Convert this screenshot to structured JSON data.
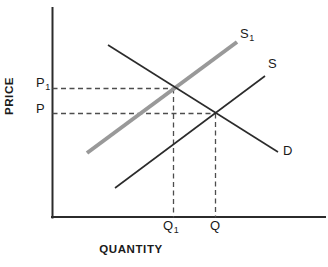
{
  "chart_data": {
    "type": "line",
    "title": "",
    "xlabel": "QUANTITY",
    "ylabel": "PRICE",
    "grid": false,
    "legend": "inline-curve-labels",
    "axes": {
      "x_axis": {
        "label": "QUANTITY",
        "ticks": [
          "Q1",
          "Q"
        ],
        "arrow": false
      },
      "y_axis": {
        "label": "PRICE",
        "ticks": [
          "P1",
          "P"
        ],
        "arrow": false
      }
    },
    "curves": [
      {
        "name": "S1",
        "label": "S₁",
        "role": "shifted-supply",
        "color": "#999999",
        "style": "solid",
        "width": 4,
        "points": [
          [
            87,
            153
          ],
          [
            237,
            42
          ]
        ]
      },
      {
        "name": "S",
        "label": "S",
        "role": "supply",
        "color": "#2b2b2b",
        "style": "solid",
        "width": 1.6,
        "points": [
          [
            115,
            188
          ],
          [
            265,
            76
          ]
        ]
      },
      {
        "name": "D",
        "label": "D",
        "role": "demand",
        "color": "#2b2b2b",
        "style": "solid",
        "width": 1.6,
        "points": [
          [
            108,
            45
          ],
          [
            278,
            152
          ]
        ]
      }
    ],
    "equilibria": [
      {
        "name": "new-equilibrium",
        "price_label": "P1",
        "quantity_label": "Q1",
        "x": 173,
        "y": 88,
        "curves": [
          "S1",
          "D"
        ]
      },
      {
        "name": "original-equilibrium",
        "price_label": "P",
        "quantity_label": "Q",
        "x": 215,
        "y": 113,
        "curves": [
          "S",
          "D"
        ]
      }
    ],
    "guides": [
      {
        "name": "p1-guide",
        "orientation": "horizontal",
        "from": [
          52,
          88
        ],
        "to": [
          173,
          88
        ]
      },
      {
        "name": "p-guide",
        "orientation": "horizontal",
        "from": [
          52,
          113
        ],
        "to": [
          215,
          113
        ]
      },
      {
        "name": "q1-guide",
        "orientation": "vertical",
        "from": [
          173,
          88
        ],
        "to": [
          173,
          217
        ]
      },
      {
        "name": "q-guide",
        "orientation": "vertical",
        "from": [
          215,
          113
        ],
        "to": [
          215,
          217
        ]
      }
    ],
    "annotation": "A rightward shift of supply from S to S1 lowers price from P1 to P and raises quantity from Q1 to Q."
  },
  "labels": {
    "price_axis": "PRICE",
    "quantity_axis": "QUANTITY",
    "p1_main": "P",
    "p1_sub": "1",
    "p_main": "P",
    "q1_main": "Q",
    "q1_sub": "1",
    "q_main": "Q",
    "s1_main": "S",
    "s1_sub": "1",
    "s_main": "S",
    "d_main": "D"
  },
  "colors": {
    "axis": "#2b2b2b",
    "curve_black": "#2b2b2b",
    "curve_gray": "#999999",
    "guide": "#4d4d4d",
    "text": "#1a1a1a",
    "background": "#ffffff"
  }
}
